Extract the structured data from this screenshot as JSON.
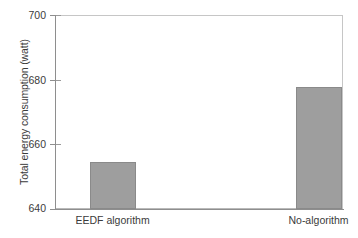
{
  "chart_data": {
    "type": "bar",
    "title": "",
    "xlabel": "",
    "ylabel": "Total energy consumption (watt)",
    "categories": [
      "EEDF algorithm",
      "No-algorithm"
    ],
    "values": [
      654.5,
      677.7
    ],
    "ylim": [
      640,
      700
    ],
    "yticks": [
      640,
      660,
      680,
      700
    ],
    "ytick_labels": [
      "640",
      "660",
      "680",
      "700"
    ],
    "grid": false,
    "legend": null,
    "bar_color": "#9e9e9e",
    "bar_edge_color": "#8a8a8a",
    "axis_color": "#8e8e8e",
    "background": "#ffffff"
  },
  "axis": {
    "ytick_0": "640",
    "ytick_1": "660",
    "ytick_2": "680",
    "ytick_3": "700",
    "xtick_0": "EEDF algorithm",
    "xtick_1": "No-algorithm",
    "ylabel": "Total energy consumption (watt)"
  }
}
